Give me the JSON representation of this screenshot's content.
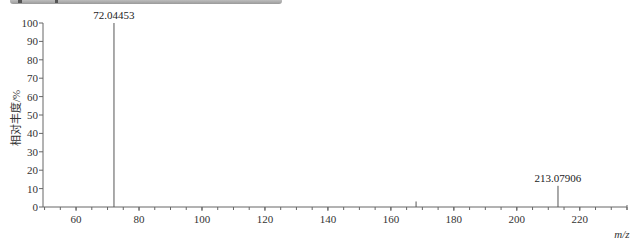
{
  "toolbar": {
    "visible": true
  },
  "chart_data": {
    "type": "bar",
    "title": "",
    "xlabel": "m/z",
    "ylabel": "相对丰度/%",
    "xlim": [
      49.5,
      235
    ],
    "ylim": [
      0,
      100
    ],
    "x_ticks": [
      60,
      80,
      100,
      120,
      140,
      160,
      180,
      200,
      220
    ],
    "y_ticks": [
      0,
      10,
      20,
      30,
      40,
      50,
      60,
      70,
      80,
      90,
      100
    ],
    "grid": false,
    "legend": null,
    "peaks": [
      {
        "mz": 72.04453,
        "intensity": 100,
        "label": "72.04453"
      },
      {
        "mz": 168.0,
        "intensity": 3,
        "label": ""
      },
      {
        "mz": 213.07906,
        "intensity": 11.5,
        "label": "213.07906"
      }
    ],
    "annotations": [
      "72.04453",
      "213.07906"
    ]
  },
  "labels": {
    "peak1": "72.04453",
    "peak2": "213.07906",
    "xlabel": "m/z",
    "ylabel": "相对丰度/%"
  }
}
